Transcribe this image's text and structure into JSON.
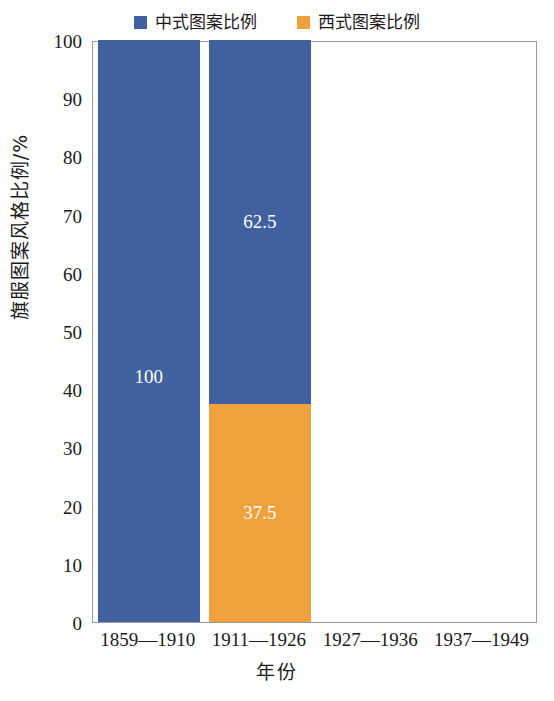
{
  "chart_data": {
    "type": "bar",
    "subtype": "stacked-bar",
    "title": "",
    "xlabel": "年份",
    "ylabel": "旗服图案风格比例/%",
    "categories": [
      "1859—1910",
      "1911—1926",
      "1927—1936",
      "1937—1949"
    ],
    "series": [
      {
        "name": "中式图案比例",
        "color": "#41609F",
        "values": [
          100,
          62.5,
          null,
          null
        ],
        "labels": [
          "100",
          "62.5",
          "",
          ""
        ]
      },
      {
        "name": "西式图案比例",
        "color": "#EFA13E",
        "values": [
          0,
          37.5,
          null,
          null
        ],
        "labels": [
          "",
          "37.5",
          "",
          ""
        ]
      }
    ],
    "ylim": [
      0,
      100
    ],
    "ytick_values": [
      0,
      10,
      20,
      30,
      40,
      50,
      60,
      70,
      80,
      90,
      100
    ],
    "ytick_labels": [
      "0",
      "10",
      "20",
      "30",
      "40",
      "50",
      "60",
      "70",
      "80",
      "90",
      "100"
    ],
    "grid": false,
    "legend_position": "top-center",
    "stack_order": "series-0-on-top"
  },
  "legend": {
    "items": [
      {
        "label": "中式图案比例",
        "color": "#41609F",
        "marker": "square-swatch-icon"
      },
      {
        "label": "西式图案比例",
        "color": "#EFA13E",
        "marker": "square-swatch-icon"
      }
    ]
  },
  "axes": {
    "y_title": "旗服图案风格比例/%",
    "x_title": "年份"
  },
  "colors": {
    "series_chinese": "#41609F",
    "series_western": "#EFA13E",
    "frame": "#9a9a9a",
    "text": "#1a1a1a",
    "value_label": "#ffffff",
    "background": "#ffffff"
  }
}
